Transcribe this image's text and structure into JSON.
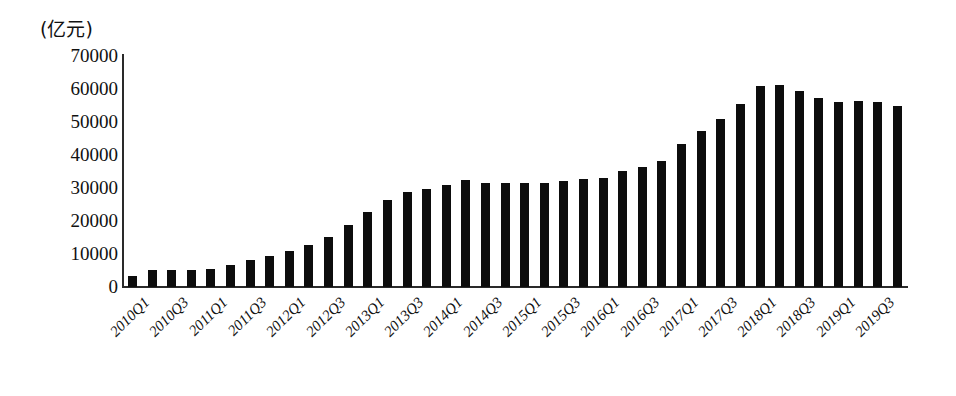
{
  "chart_data": {
    "type": "bar",
    "title": "",
    "subtitle": "",
    "unit_label": "(亿元)",
    "xlabel": "",
    "ylabel": "",
    "ylim": [
      0,
      70000
    ],
    "ytick_labels": [
      "70000",
      "60000",
      "50000",
      "40000",
      "30000",
      "20000",
      "10000",
      "0"
    ],
    "ytick_values": [
      70000,
      60000,
      50000,
      40000,
      30000,
      20000,
      10000,
      0
    ],
    "grid": false,
    "legend": null,
    "bar_color": "#0d0d0d",
    "axis_color": "#2a2a2a",
    "categories": [
      "2010Q1",
      "2010Q2",
      "2010Q3",
      "2010Q4",
      "2011Q1",
      "2011Q2",
      "2011Q3",
      "2011Q4",
      "2012Q1",
      "2012Q2",
      "2012Q3",
      "2012Q4",
      "2013Q1",
      "2013Q2",
      "2013Q3",
      "2013Q4",
      "2014Q1",
      "2014Q2",
      "2014Q3",
      "2014Q4",
      "2015Q1",
      "2015Q2",
      "2015Q3",
      "2015Q4",
      "2016Q1",
      "2016Q2",
      "2016Q3",
      "2016Q4",
      "2017Q1",
      "2017Q2",
      "2017Q3",
      "2017Q4",
      "2018Q1",
      "2018Q2",
      "2018Q3",
      "2018Q4",
      "2019Q1",
      "2019Q2",
      "2019Q3",
      "2019Q4"
    ],
    "values": [
      3300,
      5200,
      5200,
      5200,
      5400,
      6800,
      8200,
      9500,
      11000,
      12800,
      15300,
      18800,
      22800,
      26500,
      28700,
      29800,
      31000,
      32300,
      31500,
      31400,
      31600,
      31600,
      32000,
      32600,
      33000,
      35300,
      36300,
      38200,
      43300,
      47300,
      51000,
      55400,
      61000,
      61200,
      59500,
      57300,
      56200,
      56300,
      56100,
      54800
    ],
    "xtick_labels": [
      "2010Q1",
      "2010Q3",
      "2011Q1",
      "2011Q3",
      "2012Q1",
      "2012Q3",
      "2013Q1",
      "2013Q3",
      "2014Q1",
      "2014Q3",
      "2015Q1",
      "2015Q3",
      "2016Q1",
      "2016Q3",
      "2017Q1",
      "2017Q3",
      "2018Q1",
      "2018Q3",
      "2019Q1",
      "2019Q3"
    ],
    "xtick_indices": [
      0,
      2,
      4,
      6,
      8,
      10,
      12,
      14,
      16,
      18,
      20,
      22,
      24,
      26,
      28,
      30,
      32,
      34,
      36,
      38
    ]
  }
}
